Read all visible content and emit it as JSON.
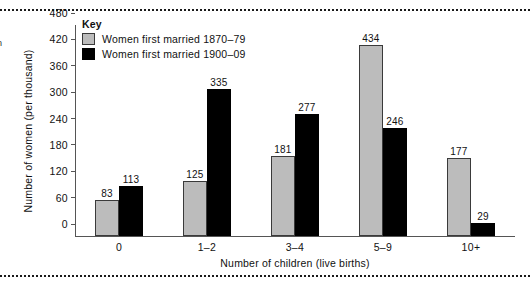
{
  "decor": {
    "left_fragment": "n"
  },
  "key": {
    "title": "Key",
    "items": [
      {
        "label": "Women first married 1870–79",
        "color": "#bcbcbc"
      },
      {
        "label": "Women first married 1900–09",
        "color": "#000000"
      }
    ]
  },
  "chart_data": {
    "type": "bar",
    "title": "",
    "xlabel": "Number of children (live births)",
    "ylabel": "Number of women (per thousand)",
    "categories": [
      "0",
      "1–2",
      "3–4",
      "5–9",
      "10+"
    ],
    "series": [
      {
        "name": "Women first married 1870–79",
        "color": "#bcbcbc",
        "values": [
          83,
          125,
          181,
          434,
          177
        ]
      },
      {
        "name": "Women first married 1900–09",
        "color": "#000000",
        "values": [
          113,
          335,
          277,
          246,
          29
        ]
      }
    ],
    "ylim": [
      0,
      480
    ],
    "yticks": [
      0,
      60,
      120,
      180,
      240,
      300,
      360,
      420,
      480
    ],
    "grid": false,
    "legend_position": "top-left",
    "legend_title": "Key",
    "data_labels": true
  }
}
